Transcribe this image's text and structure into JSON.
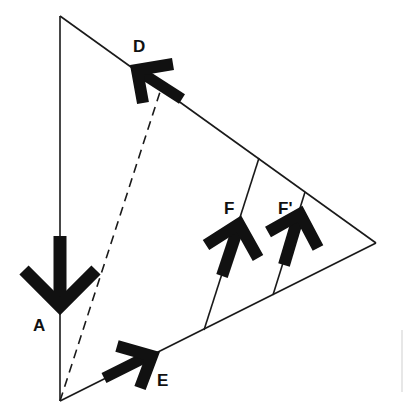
{
  "diagram": {
    "type": "geometric-vector-diagram",
    "colors": {
      "line": "#1a1a1a",
      "arrow": "#111111",
      "background": "#ffffff",
      "faint_mark": "#cfcfcf"
    },
    "triangle": {
      "vertices": {
        "top": [
          60,
          16
        ],
        "bottom": [
          60,
          401
        ],
        "right": [
          376,
          243
        ]
      }
    },
    "dashed_line": {
      "from": [
        60,
        401
      ],
      "to": [
        160,
        92
      ]
    },
    "cross_lines": [
      {
        "name": "F-line",
        "from": [
          204,
          330
        ],
        "to": [
          259,
          158
        ]
      },
      {
        "name": "F-prime-line",
        "from": [
          273,
          295
        ],
        "to": [
          305,
          192
        ]
      }
    ],
    "labels": {
      "A": "A",
      "D": "D",
      "E": "E",
      "F": "F",
      "F_prime": "F'"
    }
  }
}
